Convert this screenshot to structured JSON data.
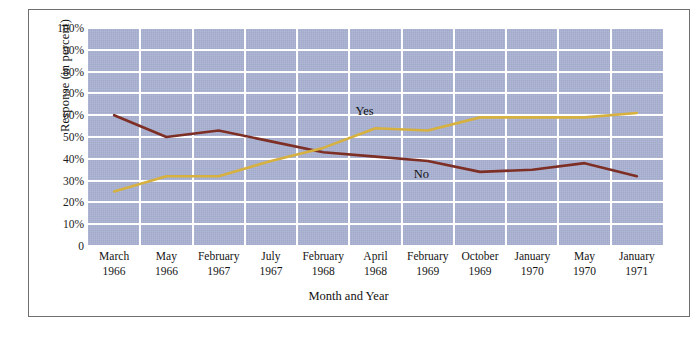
{
  "figure": {
    "credit": "© Cengage Learning"
  },
  "axes": {
    "ylabel": "Response (in percent)",
    "xlabel": "Month and Year",
    "yticks": [
      "100%",
      "90%",
      "80%",
      "70%",
      "60%",
      "50%",
      "40%",
      "30%",
      "20%",
      "10%",
      "0"
    ],
    "ytick_values": [
      100,
      90,
      80,
      70,
      60,
      50,
      40,
      30,
      20,
      10,
      0
    ]
  },
  "colors": {
    "plot_background": "#a8b0d2",
    "gridline": "#ffffff",
    "yes_line": "#d6b13f",
    "no_line": "#7e2f25",
    "frame": "#6f6f6f",
    "text": "#141414"
  },
  "series_labels": [
    {
      "name": "yes-series-label",
      "text": "Yes"
    },
    {
      "name": "no-series-label",
      "text": "No"
    }
  ],
  "chart_data": {
    "type": "line",
    "title": "",
    "xlabel": "Month and Year",
    "ylabel": "Response (in percent)",
    "ylim": [
      0,
      100
    ],
    "grid": true,
    "legend": "inline-annotations",
    "categories": [
      "March 1966",
      "May 1966",
      "February 1967",
      "July 1967",
      "February 1968",
      "April 1968",
      "February 1969",
      "October 1969",
      "January 1970",
      "May 1970",
      "January 1971"
    ],
    "category_months": [
      "March",
      "May",
      "February",
      "July",
      "February",
      "April",
      "February",
      "October",
      "January",
      "May",
      "January"
    ],
    "category_years": [
      "1966",
      "1966",
      "1967",
      "1967",
      "1968",
      "1968",
      "1969",
      "1969",
      "1970",
      "1970",
      "1971"
    ],
    "series": [
      {
        "name": "Yes",
        "color": "#d6b13f",
        "values": [
          25,
          32,
          32,
          39,
          45,
          54,
          53,
          59,
          59,
          59,
          61
        ]
      },
      {
        "name": "No",
        "color": "#7e2f25",
        "values": [
          60,
          50,
          53,
          48,
          43,
          41,
          39,
          34,
          35,
          38,
          32
        ]
      }
    ]
  }
}
